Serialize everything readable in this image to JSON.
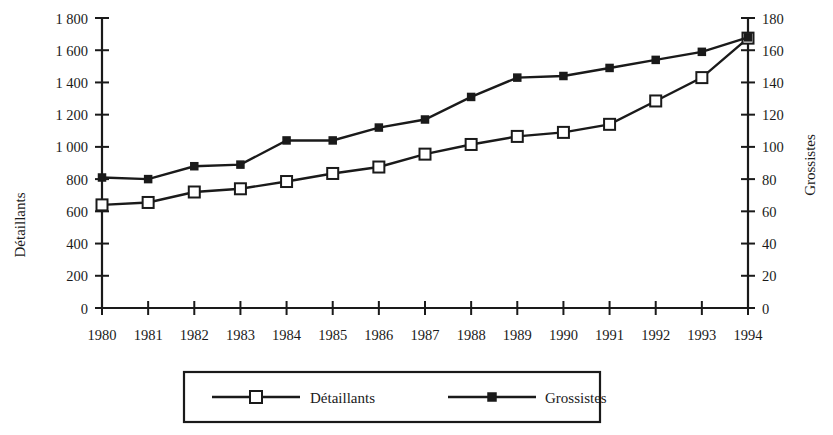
{
  "chart_data": {
    "type": "line",
    "title": "",
    "subtitle": "",
    "xlabel": "",
    "ylabel": "Détaillants",
    "y2label": "Grossistes",
    "grid": false,
    "legend_position": "bottom",
    "categories": [
      "1980",
      "1981",
      "1982",
      "1983",
      "1984",
      "1985",
      "1986",
      "1987",
      "1988",
      "1989",
      "1990",
      "1991",
      "1992",
      "1993",
      "1994"
    ],
    "x": [
      1980,
      1981,
      1982,
      1983,
      1984,
      1985,
      1986,
      1987,
      1988,
      1989,
      1990,
      1991,
      1992,
      1993,
      1994
    ],
    "ylim": [
      0,
      1800
    ],
    "y2lim": [
      0,
      180
    ],
    "yticks": [
      0,
      200,
      400,
      600,
      800,
      1000,
      1200,
      1400,
      1600,
      1800
    ],
    "ytick_labels": [
      "0",
      "200",
      "400",
      "600",
      "800",
      "1 000",
      "1 200",
      "1 400",
      "1 600",
      "1 800"
    ],
    "y2ticks": [
      0,
      20,
      40,
      60,
      80,
      100,
      120,
      140,
      160,
      180
    ],
    "y2tick_labels": [
      "0",
      "20",
      "40",
      "60",
      "80",
      "100",
      "120",
      "140",
      "160",
      "180"
    ],
    "series": [
      {
        "name": "Détaillants",
        "axis": "left",
        "marker": "open-square",
        "values": [
          640,
          655,
          720,
          740,
          785,
          835,
          875,
          955,
          1015,
          1065,
          1090,
          1140,
          1285,
          1430,
          1675
        ]
      },
      {
        "name": "Grossistes",
        "axis": "right",
        "marker": "filled-square",
        "values": [
          81,
          80,
          88,
          89,
          104,
          104,
          112,
          117,
          131,
          143,
          144,
          149,
          154,
          159,
          168
        ]
      }
    ]
  },
  "legend": {
    "entries": [
      {
        "label": "Détaillants",
        "marker": "open-square"
      },
      {
        "label": "Grossistes",
        "marker": "filled-square"
      }
    ]
  },
  "colors": {
    "ink": "#1a1a1a",
    "background": "#ffffff",
    "marker_fill_open": "#ffffff",
    "marker_fill_solid": "#1a1a1a"
  }
}
